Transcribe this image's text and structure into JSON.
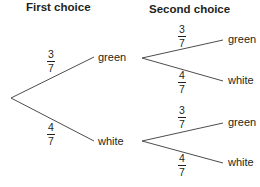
{
  "headers": {
    "first": "First choice",
    "second": "Second choice"
  },
  "line_color": "#4d4d4f",
  "first_level": {
    "green": {
      "label": "green",
      "prob": {
        "num": "3",
        "den": "7"
      }
    },
    "white": {
      "label": "white",
      "prob": {
        "num": "4",
        "den": "7"
      }
    }
  },
  "second_level": {
    "after_green": {
      "green": {
        "label": "green",
        "prob": {
          "num": "3",
          "den": "7"
        }
      },
      "white": {
        "label": "white",
        "prob": {
          "num": "4",
          "den": "7"
        }
      }
    },
    "after_white": {
      "green": {
        "label": "green",
        "prob": {
          "num": "3",
          "den": "7"
        }
      },
      "white": {
        "label": "white",
        "prob": {
          "num": "4",
          "den": "7"
        }
      }
    }
  }
}
